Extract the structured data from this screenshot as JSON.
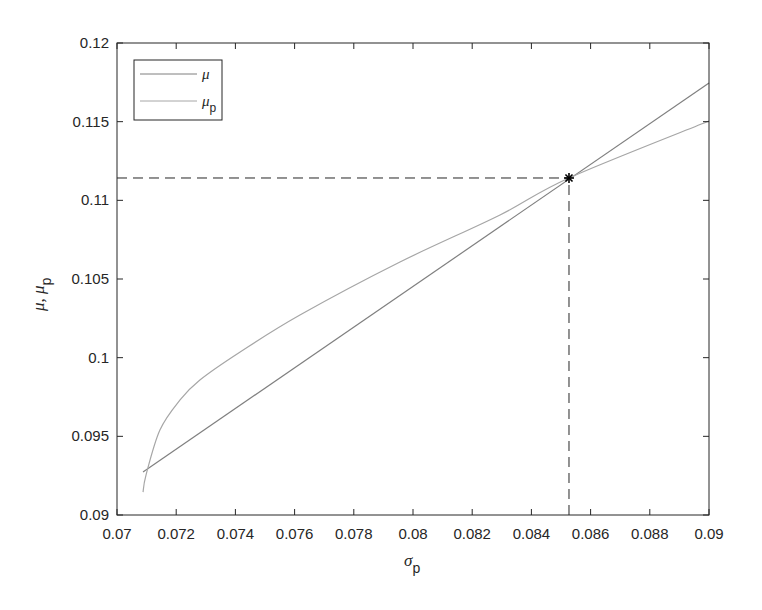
{
  "chart_data": {
    "type": "line",
    "title": "",
    "xlabel": "σ_p",
    "ylabel": "μ, μ_p",
    "xlim": [
      0.07,
      0.09
    ],
    "ylim": [
      0.09,
      0.12
    ],
    "grid": false,
    "legend_position": "upper-left",
    "x_ticks": [
      "0.07",
      "0.072",
      "0.074",
      "0.076",
      "0.078",
      "0.08",
      "0.082",
      "0.084",
      "0.086",
      "0.088",
      "0.09"
    ],
    "y_ticks": [
      "0.09",
      "0.095",
      "0.1",
      "0.105",
      "0.11",
      "0.115",
      "0.12"
    ],
    "series": [
      {
        "name": "μ",
        "style": "solid",
        "color": "#7f7f7f",
        "x": [
          0.07088,
          0.09
        ],
        "y": [
          0.09273,
          0.11746
        ]
      },
      {
        "name": "μ_p",
        "style": "solid",
        "color": "#a6a6a6",
        "x": [
          0.07088,
          0.07098,
          0.07145,
          0.07213,
          0.0728,
          0.07416,
          0.07618,
          0.07956,
          0.08294,
          0.08527,
          0.09
        ],
        "y": [
          0.09146,
          0.09254,
          0.0954,
          0.09731,
          0.09858,
          0.10036,
          0.10271,
          0.10608,
          0.10907,
          0.11142,
          0.11504
        ]
      }
    ],
    "annotations": [
      {
        "type": "marker",
        "symbol": "*",
        "x": 0.08527,
        "y": 0.11142,
        "label": "intersection"
      },
      {
        "type": "dashed-line",
        "from": [
          0.07,
          0.11142
        ],
        "to": [
          0.08527,
          0.11142
        ]
      },
      {
        "type": "dashed-line",
        "from": [
          0.08527,
          0.09
        ],
        "to": [
          0.08527,
          0.11142
        ]
      }
    ]
  },
  "legend": {
    "items": [
      {
        "label": "μ",
        "sub": ""
      },
      {
        "label": "μ",
        "sub": "p"
      }
    ]
  },
  "axes": {
    "xlabel_main": "σ",
    "xlabel_sub": "p",
    "ylabel_main": "μ, μ",
    "ylabel_sub": "p"
  }
}
